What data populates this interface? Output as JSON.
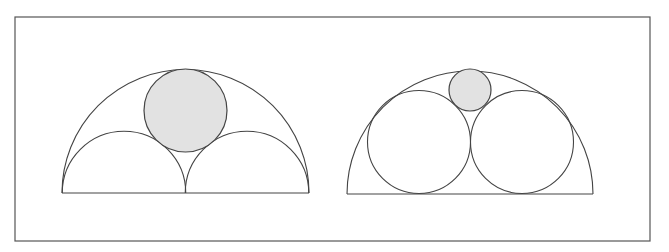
{
  "diagram": {
    "frame": {
      "x": 15,
      "y": 17,
      "width": 635,
      "height": 224,
      "stroke": "#555555"
    },
    "colors": {
      "stroke": "#444444",
      "fill_shaded": "#e2e2e2",
      "background": "#ffffff"
    },
    "figures": [
      {
        "name": "left-figure",
        "outer_semicircle": {
          "cx": 185.5,
          "cy": 193,
          "r": 123.5
        },
        "inner_semicircles": [
          {
            "cx": 124,
            "cy": 193,
            "r": 61.75
          },
          {
            "cx": 247,
            "cy": 193,
            "r": 61.75
          }
        ],
        "shaded_circle": {
          "cx": 185.5,
          "cy": 110.5,
          "r": 41.5
        }
      },
      {
        "name": "right-figure",
        "outer_semicircle": {
          "cx": 470,
          "cy": 194,
          "r": 123
        },
        "inner_circles": [
          {
            "cx": 419,
            "cy": 142,
            "r": 51.5
          },
          {
            "cx": 522,
            "cy": 142,
            "r": 51.5
          }
        ],
        "shaded_circle": {
          "cx": 470,
          "cy": 90,
          "r": 21
        }
      }
    ]
  }
}
